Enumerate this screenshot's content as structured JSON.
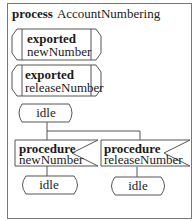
{
  "diagram": {
    "type": "SDL process diagram",
    "frame": {
      "keyword": "process",
      "name": "AccountNumbering"
    },
    "exported_procedures": [
      {
        "keyword": "exported",
        "name": "newNumber"
      },
      {
        "keyword": "exported",
        "name": "releaseNumber"
      }
    ],
    "start_state": {
      "label": "idle"
    },
    "inputs": [
      {
        "keyword": "procedure",
        "name": "newNumber",
        "next_state": "idle"
      },
      {
        "keyword": "procedure",
        "name": "releaseNumber",
        "next_state": "idle"
      }
    ],
    "colors": {
      "line": "#555555",
      "text": "#1a1a1a",
      "background": "#ffffff"
    }
  }
}
